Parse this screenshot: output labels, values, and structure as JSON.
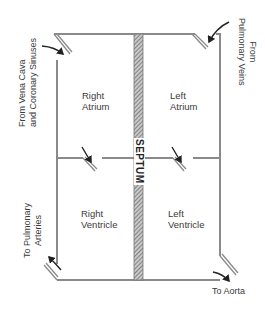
{
  "diagram": {
    "type": "heart-chambers-schematic",
    "septum_label": "SEPTUM",
    "chambers": {
      "right_atrium": [
        "Right",
        "Atrium"
      ],
      "left_atrium": [
        "Left",
        "Atrium"
      ],
      "right_ventricle": [
        "Right",
        "Ventricle"
      ],
      "left_ventricle": [
        "Left",
        "Ventricle"
      ]
    },
    "flow_labels": {
      "vena_cava": [
        "From Vena Cava",
        "and Coronary Sinuses"
      ],
      "pulmonary_veins": [
        "From",
        "Pulmonary Veins"
      ],
      "pulmonary_arteries": [
        "To Pulmonary",
        "Arteries"
      ],
      "aorta": "To Aorta"
    },
    "colors": {
      "wall": "#8a8a8a",
      "septum_fill": "#9a9a9a",
      "arrow": "#222222",
      "text": "#3a3a3a",
      "background": "#ffffff"
    }
  }
}
